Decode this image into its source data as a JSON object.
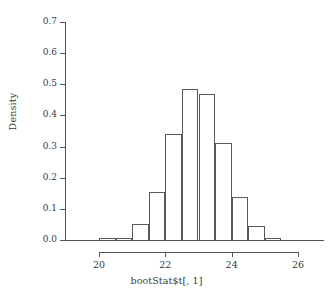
{
  "chart_data": {
    "type": "bar",
    "subtype": "histogram",
    "title": "",
    "subtitle": "",
    "xlabel": "bootStat$t[, 1]",
    "ylabel": "Density",
    "xlim": [
      19.55,
      27.3
    ],
    "ylim": [
      0.0,
      0.7
    ],
    "grid": false,
    "legend": null,
    "bin_width": 0.5,
    "bin_edges": [
      20.0,
      20.5,
      21.0,
      21.5,
      22.0,
      22.5,
      23.0,
      23.5,
      24.0,
      24.5,
      25.0,
      25.5
    ],
    "categories": [
      "20.0-20.5",
      "20.5-21.0",
      "21.0-21.5",
      "21.5-22.0",
      "22.0-22.5",
      "22.5-23.0",
      "23.0-23.5",
      "23.5-24.0",
      "24.0-24.5",
      "24.5-25.0",
      "25.0-25.5"
    ],
    "values": [
      0.005,
      0.008,
      0.05,
      0.155,
      0.34,
      0.485,
      0.47,
      0.31,
      0.137,
      0.045,
      0.008
    ],
    "bars": [
      {
        "x0": 20.0,
        "x1": 20.5,
        "height": 0.005
      },
      {
        "x0": 20.5,
        "x1": 21.0,
        "height": 0.008
      },
      {
        "x0": 21.0,
        "x1": 21.5,
        "height": 0.05
      },
      {
        "x0": 21.5,
        "x1": 22.0,
        "height": 0.155
      },
      {
        "x0": 22.0,
        "x1": 22.5,
        "height": 0.34
      },
      {
        "x0": 22.5,
        "x1": 23.0,
        "height": 0.485
      },
      {
        "x0": 23.0,
        "x1": 23.5,
        "height": 0.47
      },
      {
        "x0": 23.5,
        "x1": 24.0,
        "height": 0.31
      },
      {
        "x0": 24.0,
        "x1": 24.5,
        "height": 0.137
      },
      {
        "x0": 24.5,
        "x1": 25.0,
        "height": 0.045
      },
      {
        "x0": 25.0,
        "x1": 25.5,
        "height": 0.008
      }
    ],
    "x_ticks": [
      20,
      22,
      24,
      26
    ],
    "x_tick_labels": [
      "20",
      "22",
      "24",
      "26"
    ],
    "y_ticks": [
      0.0,
      0.1,
      0.2,
      0.3,
      0.4,
      0.5,
      0.6,
      0.7
    ],
    "y_tick_labels": [
      "0.0",
      "0.1",
      "0.2",
      "0.3",
      "0.4",
      "0.5",
      "0.6",
      "0.7"
    ],
    "colors": {
      "bar_stroke": "#595959",
      "bar_fill": "transparent",
      "axis": "#555555",
      "text": "#3a3a3a",
      "background": "#ffffff"
    }
  }
}
